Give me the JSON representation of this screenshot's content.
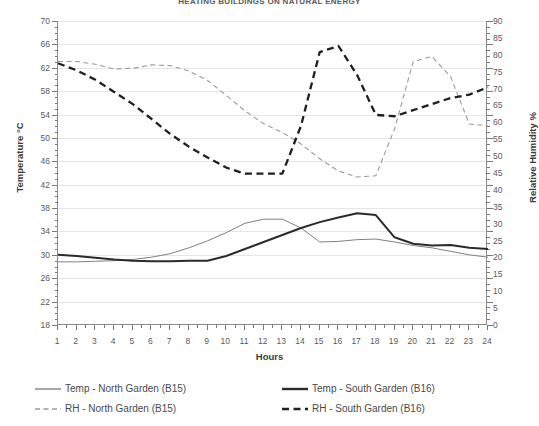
{
  "chart_data": {
    "type": "line",
    "title": "HEATING BUILDINGS ON NATURAL ENERGY",
    "xlabel": "Hours",
    "ylabel": "Temperature °C",
    "ylabel_right": "Relative Humidity %",
    "x": [
      1,
      2,
      3,
      4,
      5,
      6,
      7,
      8,
      9,
      10,
      11,
      12,
      13,
      14,
      15,
      16,
      17,
      18,
      19,
      20,
      21,
      22,
      23,
      24
    ],
    "xlim": [
      1,
      24
    ],
    "ylim": [
      18,
      70
    ],
    "ylim_right": [
      0,
      90
    ],
    "ytick_step": 4,
    "ytick_step_right": 5,
    "grid": true,
    "legend_position": "bottom",
    "series": [
      {
        "name": "Temp - North Garden (B15)",
        "axis": "left",
        "style": "solid-thin",
        "color": "#808080",
        "values": [
          28.8,
          28.8,
          28.9,
          29.0,
          29.2,
          29.6,
          30.2,
          31.2,
          32.4,
          33.8,
          35.4,
          36.1,
          36.1,
          34.6,
          32.2,
          32.3,
          32.6,
          32.7,
          32.2,
          31.6,
          31.2,
          30.6,
          30.0,
          29.6
        ]
      },
      {
        "name": "Temp - South Garden (B16)",
        "axis": "left",
        "style": "solid-thick",
        "color": "#2b2b2b",
        "values": [
          30.0,
          29.8,
          29.5,
          29.2,
          29.0,
          28.9,
          28.9,
          29.0,
          29.0,
          29.8,
          31.0,
          32.2,
          33.4,
          34.6,
          35.6,
          36.4,
          37.1,
          36.8,
          33.0,
          31.9,
          31.6,
          31.7,
          31.2,
          31.0
        ]
      },
      {
        "name": "RH - North Garden (B15)",
        "axis": "right",
        "style": "dashed-thin",
        "color": "#9a9a9a",
        "values": [
          78.0,
          78.0,
          77.2,
          75.8,
          76.0,
          77.0,
          76.8,
          75.2,
          72.4,
          68.0,
          63.4,
          59.6,
          57.0,
          53.6,
          49.2,
          45.6,
          43.8,
          44.2,
          58.0,
          78.0,
          79.5,
          73.5,
          59.5,
          59.0
        ]
      },
      {
        "name": "RH - South Garden (B16)",
        "axis": "right",
        "style": "dashed-thick",
        "color": "#1f1f1f",
        "values": [
          77.5,
          75.4,
          72.6,
          69.0,
          65.4,
          61.0,
          56.6,
          52.8,
          49.6,
          46.6,
          44.8,
          44.8,
          44.8,
          59.0,
          80.8,
          82.6,
          74.0,
          62.2,
          61.8,
          63.6,
          65.4,
          67.2,
          68.2,
          70.4
        ]
      }
    ]
  },
  "axes": {
    "left_ticks": [
      "70",
      "66",
      "62",
      "58",
      "54",
      "50",
      "46",
      "42",
      "38",
      "34",
      "30",
      "26",
      "22",
      "18"
    ],
    "right_ticks": [
      "90",
      "85",
      "80",
      "75",
      "70",
      "65",
      "60",
      "55",
      "50",
      "45",
      "40",
      "35",
      "30",
      "25",
      "20",
      "15",
      "10",
      "5",
      "0"
    ],
    "x_ticks": [
      "1",
      "2",
      "3",
      "4",
      "5",
      "6",
      "7",
      "8",
      "9",
      "10",
      "11",
      "12",
      "13",
      "14",
      "15",
      "16",
      "17",
      "18",
      "19",
      "20",
      "21",
      "22",
      "23",
      "24"
    ]
  },
  "legend": {
    "items": [
      {
        "label": "Temp - North Garden (B15)",
        "color": "#808080",
        "style": "solid-thin"
      },
      {
        "label": "Temp - South Garden (B16)",
        "color": "#2b2b2b",
        "style": "solid-thick"
      },
      {
        "label": "RH - North Garden (B15)",
        "color": "#9a9a9a",
        "style": "dashed-thin"
      },
      {
        "label": "RH - South Garden (B16)",
        "color": "#1f1f1f",
        "style": "dashed-thick"
      }
    ]
  }
}
